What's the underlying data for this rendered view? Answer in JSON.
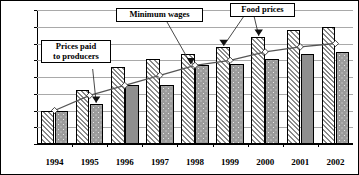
{
  "chart_data": {
    "type": "bar",
    "title": "",
    "subtitle": "",
    "xlabel": "",
    "ylabel": "",
    "ylim": [
      0,
      400
    ],
    "yticks": [
      0,
      50,
      100,
      150,
      200,
      250,
      300,
      350,
      400
    ],
    "grid": true,
    "legend_position": "annotations",
    "categories": [
      "1994",
      "1995",
      "1996",
      "1997",
      "1998",
      "1999",
      "2000",
      "2001",
      "2002"
    ],
    "series": [
      {
        "name": "Food prices",
        "style": "bar-diagonal-hatch",
        "values": [
          100,
          160,
          230,
          255,
          270,
          290,
          320,
          340,
          350
        ]
      },
      {
        "name": "Prices paid to producers",
        "style": "bar-dotted-gray",
        "values": [
          100,
          120,
          175,
          175,
          235,
          240,
          255,
          270,
          275
        ]
      },
      {
        "name": "Minimum wages",
        "style": "line-diamond-marker",
        "values": [
          100,
          145,
          175,
          205,
          235,
          250,
          275,
          290,
          300
        ]
      }
    ],
    "annotations": [
      {
        "id": "prices-paid",
        "label": "Prices paid\nto producers",
        "points_to_category": "1995",
        "points_to_series": "Prices paid to producers"
      },
      {
        "id": "minimum-wages",
        "label": "Minimum wages",
        "points_to_category": "1998",
        "points_to_series": "Minimum wages"
      },
      {
        "id": "food-prices",
        "label": "Food prices",
        "points_to_category": "2000",
        "points_to_series": "Food prices"
      }
    ]
  },
  "axis": {
    "y_labels": [
      "400",
      "350",
      "300",
      "250",
      "200",
      "150",
      "100",
      "50",
      "0"
    ]
  },
  "colors": {
    "axis": "#000000",
    "grid": "#a9a9a9",
    "bar_hatch_fill": "#ffffff",
    "bar_hatch_stroke": "#8a8a8a",
    "bar_dotted_fill": "#9b9b9b",
    "bar_solid_fill": "#8f8f8f",
    "line": "#555555",
    "marker": "#ffffff",
    "text": "#000000"
  }
}
